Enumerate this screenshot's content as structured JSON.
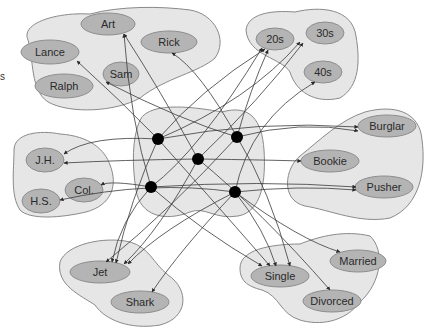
{
  "diagram": {
    "title": "",
    "side_fragment_label": "s",
    "colors": {
      "pool_fill": "#e6e6e6",
      "pool_stroke": "#8a8a8a",
      "unit_fill": "#b4b4b4",
      "hub_fill": "#000000",
      "edge": "#3a3a3a"
    },
    "pools": [
      {
        "id": "names",
        "path": "M28,40 C20,22 60,12 90,14 C120,6 160,6 190,10 C215,14 228,40 215,58 C200,72 165,78 140,98 C115,112 70,114 48,102 C30,90 34,60 28,40 Z",
        "units": [
          {
            "label": "Art",
            "cx": 108,
            "cy": 24,
            "rx": 27,
            "ry": 11
          },
          {
            "label": "Rick",
            "cx": 169,
            "cy": 42,
            "rx": 28,
            "ry": 11
          },
          {
            "label": "Lance",
            "cx": 50,
            "cy": 52,
            "rx": 29,
            "ry": 12
          },
          {
            "label": "Sam",
            "cx": 121,
            "cy": 74,
            "rx": 18,
            "ry": 12
          },
          {
            "label": "Ralph",
            "cx": 64,
            "cy": 86,
            "rx": 29,
            "ry": 12
          }
        ]
      },
      {
        "id": "ages",
        "path": "M246,30 C248,14 270,10 295,12 C320,6 352,8 356,36 C360,60 360,86 340,98 C315,104 296,92 290,72 C282,58 248,56 246,30 Z",
        "units": [
          {
            "label": "20s",
            "cx": 275,
            "cy": 39,
            "rx": 19,
            "ry": 11
          },
          {
            "label": "30s",
            "cx": 325,
            "cy": 33,
            "rx": 19,
            "ry": 11
          },
          {
            "label": "40s",
            "cx": 323,
            "cy": 72,
            "rx": 19,
            "ry": 11
          }
        ]
      },
      {
        "id": "hidden",
        "path": "M140,120 C150,100 200,108 222,112 C250,104 262,120 264,150 C266,180 262,212 238,216 C215,220 205,206 190,212 C165,222 140,216 136,190 C132,165 132,138 140,120 Z",
        "units": []
      },
      {
        "id": "education",
        "path": "M14,150 C14,133 40,130 60,134 C90,136 105,150 110,165 C118,185 112,205 86,212 C60,218 30,220 20,210 C10,195 14,170 14,150 Z",
        "units": [
          {
            "label": "J.H.",
            "cx": 45,
            "cy": 160,
            "rx": 19,
            "ry": 12
          },
          {
            "label": "Col.",
            "cx": 84,
            "cy": 190,
            "rx": 19,
            "ry": 12
          },
          {
            "label": "H.S.",
            "cx": 41,
            "cy": 201,
            "rx": 19,
            "ry": 12
          }
        ]
      },
      {
        "id": "occupation",
        "path": "M365,112 C395,104 420,112 422,140 C426,170 420,206 390,218 C360,224 330,210 305,206 C280,200 285,168 300,156 C320,140 340,120 365,112 Z",
        "units": [
          {
            "label": "Burglar",
            "cx": 387,
            "cy": 126,
            "rx": 29,
            "ry": 11
          },
          {
            "label": "Bookie",
            "cx": 330,
            "cy": 161,
            "rx": 29,
            "ry": 11
          },
          {
            "label": "Pusher",
            "cx": 384,
            "cy": 187,
            "rx": 29,
            "ry": 11
          }
        ]
      },
      {
        "id": "gang",
        "path": "M60,262 C66,244 105,236 130,242 C150,248 152,262 168,275 C190,290 188,318 160,325 C130,330 105,320 95,305 C80,295 56,285 60,262 Z",
        "units": [
          {
            "label": "Jet",
            "cx": 100,
            "cy": 272,
            "rx": 30,
            "ry": 11
          },
          {
            "label": "Shark",
            "cx": 140,
            "cy": 302,
            "rx": 29,
            "ry": 11
          }
        ]
      },
      {
        "id": "marital",
        "path": "M240,268 C240,250 270,244 300,244 C320,236 345,230 370,236 C385,250 382,282 360,302 C345,322 320,326 300,320 C280,314 280,296 262,290 C246,286 240,280 240,268 Z",
        "units": [
          {
            "label": "Married",
            "cx": 358,
            "cy": 261,
            "rx": 28,
            "ry": 11
          },
          {
            "label": "Single",
            "cx": 280,
            "cy": 276,
            "rx": 29,
            "ry": 11
          },
          {
            "label": "Divorced",
            "cx": 332,
            "cy": 301,
            "rx": 29,
            "ry": 11
          }
        ]
      }
    ],
    "hubs": [
      {
        "id": "h1",
        "cx": 158,
        "cy": 139,
        "r": 6
      },
      {
        "id": "h2",
        "cx": 237,
        "cy": 137,
        "r": 6
      },
      {
        "id": "h3",
        "cx": 198,
        "cy": 159,
        "r": 6
      },
      {
        "id": "h4",
        "cx": 151,
        "cy": 187,
        "r": 6
      },
      {
        "id": "h5",
        "cx": 235,
        "cy": 192,
        "r": 6
      }
    ],
    "edges": [
      {
        "d": "M158,139 Q120,100 77,61"
      },
      {
        "d": "M158,139 Q200,90 265,49"
      },
      {
        "d": "M158,139 Q250,100 300,42"
      },
      {
        "d": "M158,139 Q260,120 358,127"
      },
      {
        "d": "M158,139 Q90,135 64,154"
      },
      {
        "d": "M158,139 Q130,200 116,263"
      },
      {
        "d": "M158,139 Q230,220 270,266"
      },
      {
        "d": "M237,137 Q200,70 172,53"
      },
      {
        "d": "M237,137 Q250,90 268,50"
      },
      {
        "d": "M237,137 Q300,120 358,131"
      },
      {
        "d": "M237,137 Q180,120 106,82"
      },
      {
        "d": "M237,137 Q170,210 106,262"
      },
      {
        "d": "M237,137 Q270,190 290,266"
      },
      {
        "d": "M198,159 Q160,90 124,34"
      },
      {
        "d": "M198,159 Q260,100 303,43"
      },
      {
        "d": "M198,159 Q270,160 301,161"
      },
      {
        "d": "M198,159 Q120,160 64,163"
      },
      {
        "d": "M198,159 Q160,230 124,264"
      },
      {
        "d": "M198,159 Q260,210 330,290"
      },
      {
        "d": "M151,187 Q130,120 124,34"
      },
      {
        "d": "M151,187 Q200,150 262,48"
      },
      {
        "d": "M151,187 Q110,180 101,185"
      },
      {
        "d": "M151,187 Q260,180 356,187"
      },
      {
        "d": "M151,187 Q120,220 112,262"
      },
      {
        "d": "M151,187 Q200,230 262,266"
      },
      {
        "d": "M235,192 Q250,120 315,82"
      },
      {
        "d": "M235,192 Q150,180 60,200"
      },
      {
        "d": "M235,192 Q300,185 356,190"
      },
      {
        "d": "M235,192 Q160,230 128,264"
      },
      {
        "d": "M235,192 Q180,250 152,292"
      },
      {
        "d": "M235,192 Q300,240 340,252"
      },
      {
        "d": "M235,192 Q265,230 276,266"
      }
    ]
  }
}
